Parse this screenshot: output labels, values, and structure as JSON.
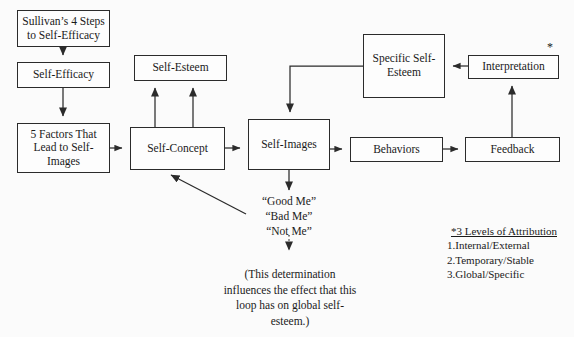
{
  "diagram": {
    "nodes": {
      "sullivan_steps": "Sullivan’s 4 Steps to Self-Efficacy",
      "self_efficacy": "Self-Efficacy",
      "five_factors": "5 Factors That Lead to Self-Images",
      "self_esteem": "Self-Esteem",
      "self_concept": "Self-Concept",
      "self_images": "Self-Images",
      "specific_self_esteem": "Specific Self-Esteem",
      "behaviors": "Behaviors",
      "feedback": "Feedback",
      "interpretation": "Interpretation"
    },
    "annotations": {
      "asterisk": "*",
      "me_labels": "“Good Me”\n“Bad Me”\n“Not Me”",
      "determination_note": "(This determination influences the effect that this loop has on global self-esteem.)"
    },
    "legend": {
      "heading": "*3 Levels of Attribution",
      "items": [
        "1.Internal/External",
        "2.Temporary/Stable",
        "3.Global/Specific"
      ]
    },
    "colors": {
      "background": "#fbfbfb",
      "ink": "#2b2b2b",
      "box_fill": "#fdfdfd"
    }
  }
}
